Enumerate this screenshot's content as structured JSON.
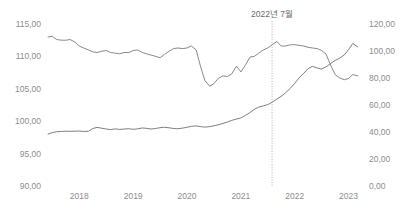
{
  "chart_data": {
    "type": "line",
    "title": "",
    "xlabel": "",
    "ylabel": "",
    "grid": false,
    "legend_position": "none",
    "x_axis": {
      "tick_labels": [
        "2018",
        "2019",
        "2020",
        "2021",
        "2022",
        "2023"
      ],
      "tick_values": [
        2018,
        2019,
        2020,
        2021,
        2022,
        2023
      ],
      "range": [
        2017.4,
        2023.25
      ]
    },
    "y_axis_left": {
      "tick_labels": [
        "115,00",
        "110,00",
        "105,00",
        "100,00",
        "95,00",
        "90,00"
      ],
      "tick_values": [
        115,
        110,
        105,
        100,
        95,
        90
      ],
      "range": [
        90,
        115
      ]
    },
    "y_axis_right": {
      "tick_labels": [
        "120,00",
        "100,00",
        "80,00",
        "60,00",
        "40,00",
        "20,00",
        "0,00"
      ],
      "tick_values": [
        120,
        100,
        80,
        60,
        40,
        20,
        0
      ],
      "range": [
        0,
        120
      ]
    },
    "annotations": [
      {
        "label": "2022년 7월",
        "x": 2021.58,
        "type": "vertical-dotted-line",
        "color": "#9a9a9a"
      }
    ],
    "series": [
      {
        "name": "series-left-axis",
        "axis": "left",
        "color": "#7a7a7a",
        "x": [
          2017.42,
          2017.5,
          2017.58,
          2017.67,
          2017.75,
          2017.83,
          2017.92,
          2018.0,
          2018.08,
          2018.17,
          2018.25,
          2018.33,
          2018.42,
          2018.5,
          2018.58,
          2018.67,
          2018.75,
          2018.83,
          2018.92,
          2019.0,
          2019.08,
          2019.17,
          2019.25,
          2019.33,
          2019.42,
          2019.5,
          2019.58,
          2019.67,
          2019.75,
          2019.83,
          2019.92,
          2020.0,
          2020.08,
          2020.17,
          2020.25,
          2020.33,
          2020.42,
          2020.5,
          2020.58,
          2020.67,
          2020.75,
          2020.83,
          2020.92,
          2021.0,
          2021.08,
          2021.17,
          2021.25,
          2021.33,
          2021.42,
          2021.5,
          2021.58,
          2021.67,
          2021.75,
          2021.83,
          2021.92,
          2022.0,
          2022.08,
          2022.17,
          2022.25,
          2022.33,
          2022.42,
          2022.5,
          2022.58,
          2022.67,
          2022.75,
          2022.83,
          2022.92,
          2023.0,
          2023.08,
          2023.17
        ],
        "values": [
          113.0,
          113.1,
          112.6,
          112.5,
          112.5,
          112.6,
          112.2,
          111.6,
          111.3,
          111.0,
          110.7,
          110.6,
          110.8,
          110.9,
          110.6,
          110.5,
          110.4,
          110.6,
          110.6,
          110.9,
          111.0,
          110.6,
          110.4,
          110.2,
          110.0,
          109.8,
          110.3,
          110.8,
          111.2,
          111.3,
          111.2,
          111.3,
          111.6,
          111.0,
          108.5,
          106.3,
          105.4,
          105.8,
          106.6,
          107.0,
          106.9,
          107.3,
          108.5,
          107.6,
          108.6,
          109.9,
          110.0,
          110.5,
          111.0,
          111.3,
          111.8,
          112.3,
          111.6,
          111.6,
          111.8,
          111.8,
          111.7,
          111.6,
          111.4,
          111.3,
          111.2,
          110.9,
          110.4,
          108.6,
          107.2,
          106.7,
          106.4,
          106.6,
          107.2,
          107.0
        ]
      },
      {
        "name": "series-right-axis",
        "axis": "right",
        "color": "#6e6e6e",
        "x": [
          2017.42,
          2017.5,
          2017.58,
          2017.67,
          2017.75,
          2017.83,
          2017.92,
          2018.0,
          2018.08,
          2018.17,
          2018.25,
          2018.33,
          2018.42,
          2018.5,
          2018.58,
          2018.67,
          2018.75,
          2018.83,
          2018.92,
          2019.0,
          2019.08,
          2019.17,
          2019.25,
          2019.33,
          2019.42,
          2019.5,
          2019.58,
          2019.67,
          2019.75,
          2019.83,
          2019.92,
          2020.0,
          2020.08,
          2020.17,
          2020.25,
          2020.33,
          2020.42,
          2020.5,
          2020.58,
          2020.67,
          2020.75,
          2020.83,
          2020.92,
          2021.0,
          2021.08,
          2021.17,
          2021.25,
          2021.33,
          2021.42,
          2021.5,
          2021.58,
          2021.67,
          2021.75,
          2021.83,
          2021.92,
          2022.0,
          2022.08,
          2022.17,
          2022.25,
          2022.33,
          2022.42,
          2022.5,
          2022.58,
          2022.67,
          2022.75,
          2022.83,
          2022.92,
          2023.0,
          2023.08,
          2023.17
        ],
        "values": [
          38.5,
          39.6,
          40.2,
          40.4,
          40.6,
          40.5,
          40.6,
          40.7,
          40.4,
          40.5,
          42.6,
          43.4,
          42.8,
          42.2,
          41.8,
          42.3,
          41.9,
          42.2,
          42.4,
          42.0,
          42.3,
          43.0,
          42.7,
          42.2,
          42.6,
          43.2,
          43.5,
          43.1,
          42.6,
          42.4,
          42.9,
          43.5,
          44.2,
          44.5,
          44.0,
          43.6,
          44.0,
          44.6,
          45.3,
          46.4,
          47.4,
          48.6,
          49.6,
          50.4,
          52.2,
          54.4,
          56.8,
          58.4,
          59.4,
          60.3,
          62.0,
          64.4,
          66.4,
          69.0,
          72.4,
          76.0,
          80.0,
          83.6,
          87.0,
          88.6,
          87.4,
          86.6,
          88.2,
          90.8,
          93.0,
          94.6,
          97.0,
          101.0,
          105.6,
          103.0
        ]
      }
    ]
  }
}
